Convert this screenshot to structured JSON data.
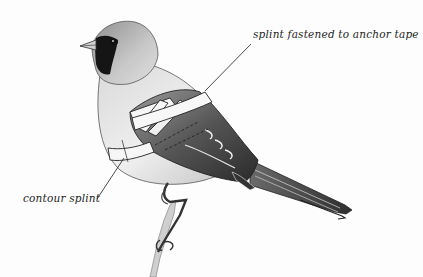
{
  "figure": {
    "colors": {
      "background": "#fdfdfd",
      "ink": "#1e1e1e",
      "plumage_light": "#e4e4e4",
      "plumage_mid": "#a8a8a8",
      "plumage_dark": "#3a3a3a",
      "mask": "#151515",
      "splint": "#f6f6f6"
    }
  },
  "annotations": [
    {
      "id": "anchor",
      "text": "splint fastened to anchor tape",
      "leader": {
        "x1": 205,
        "y1": 91,
        "x2": 251,
        "y2": 44
      }
    },
    {
      "id": "contour",
      "text": "contour splint",
      "leader": {
        "x1": 97,
        "y1": 199,
        "x2": 124,
        "y2": 158
      }
    }
  ]
}
